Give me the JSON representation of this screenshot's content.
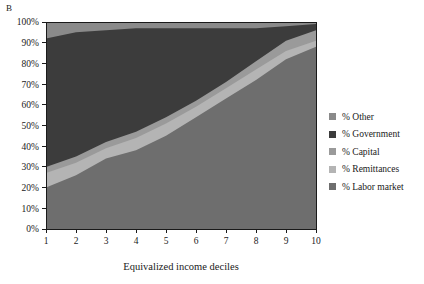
{
  "panel": {
    "label": "B"
  },
  "chart_data": {
    "type": "area",
    "stacked": true,
    "title": "",
    "subtitle": "",
    "xlabel": "Equivalized income deciles",
    "ylabel": "",
    "x": [
      1,
      2,
      3,
      4,
      5,
      6,
      7,
      8,
      9,
      10
    ],
    "xtick_labels": [
      "1",
      "2",
      "3",
      "4",
      "5",
      "6",
      "7",
      "8",
      "9",
      "10"
    ],
    "xlim": [
      1,
      10
    ],
    "ylim": [
      0,
      100
    ],
    "ytick_labels": [
      "0%",
      "10%",
      "20%",
      "30%",
      "40%",
      "50%",
      "60%",
      "70%",
      "80%",
      "90%",
      "100%"
    ],
    "ytick_values": [
      0,
      10,
      20,
      30,
      40,
      50,
      60,
      70,
      80,
      90,
      100
    ],
    "grid": false,
    "legend_position": "right",
    "stack_order_bottom_to_top": [
      "% Labor market",
      "% Remittances",
      "% Capital",
      "% Government",
      "% Other"
    ],
    "series": [
      {
        "name": "% Labor market",
        "color": "#6e6e6e",
        "values": [
          20,
          26,
          34,
          38,
          45,
          54,
          63,
          72,
          82,
          88
        ],
        "cumulative_top": [
          20,
          26,
          34,
          38,
          45,
          54,
          63,
          72,
          82,
          88
        ]
      },
      {
        "name": "% Remittances",
        "color": "#b4b4b4",
        "values": [
          7,
          6,
          5,
          6,
          6,
          5,
          5,
          5,
          4,
          3
        ],
        "cumulative_top": [
          27,
          32,
          39,
          44,
          51,
          59,
          68,
          77,
          86,
          91
        ]
      },
      {
        "name": "% Capital",
        "color": "#9a9a9a",
        "values": [
          3,
          3,
          3,
          3,
          3,
          3,
          3,
          4,
          5,
          5
        ],
        "cumulative_top": [
          30,
          35,
          42,
          47,
          54,
          62,
          71,
          81,
          91,
          96
        ]
      },
      {
        "name": "% Government",
        "color": "#3c3c3c",
        "values": [
          62,
          60,
          54,
          50,
          43,
          35,
          26,
          16,
          7,
          3
        ],
        "cumulative_top": [
          92,
          95,
          96,
          97,
          97,
          97,
          97,
          97,
          98,
          99
        ]
      },
      {
        "name": "% Other",
        "color": "#8a8a8a",
        "values": [
          8,
          5,
          4,
          3,
          3,
          3,
          3,
          3,
          2,
          1
        ],
        "cumulative_top": [
          100,
          100,
          100,
          100,
          100,
          100,
          100,
          100,
          100,
          100
        ]
      }
    ]
  },
  "legend": {
    "items": [
      {
        "label": "% Other",
        "color": "#8a8a8a"
      },
      {
        "label": "% Government",
        "color": "#3c3c3c"
      },
      {
        "label": "% Capital",
        "color": "#9a9a9a"
      },
      {
        "label": "% Remittances",
        "color": "#b4b4b4"
      },
      {
        "label": "% Labor market",
        "color": "#6e6e6e"
      }
    ]
  },
  "axes": {
    "x_title": "Equivalized income deciles"
  },
  "colors": {
    "axis": "#1a1a1a",
    "background": "#ffffff",
    "text": "#1a1a1a"
  }
}
